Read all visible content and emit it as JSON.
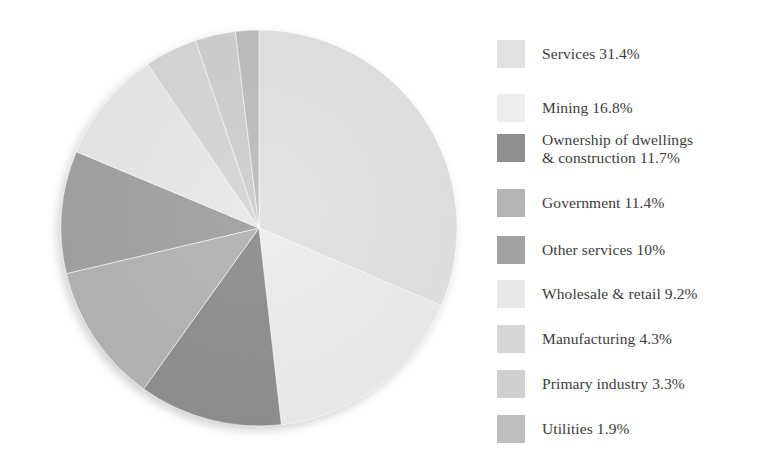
{
  "chart_data": {
    "type": "pie",
    "title": "",
    "subtitle": "",
    "xlabel": "",
    "ylabel": "",
    "legend_position": "right",
    "grid": false,
    "start_angle_deg": 0,
    "direction": "clockwise",
    "unit": "%",
    "categories": [
      "Services",
      "Mining",
      "Ownership of dwellings & construction",
      "Government",
      "Other services",
      "Wholesale & retail",
      "Manufacturing",
      "Primary industry",
      "Utilities"
    ],
    "values": [
      31.4,
      16.8,
      11.7,
      11.4,
      10.0,
      9.2,
      4.3,
      3.3,
      1.9
    ],
    "colors": [
      "#e2e2e2",
      "#ededed",
      "#8f8f8f",
      "#b4b4b4",
      "#a2a2a2",
      "#e8e8e8",
      "#d6d6d6",
      "#cfcfcf",
      "#bdbdbd"
    ],
    "slices": [
      {
        "label": "Services",
        "value": 31.4,
        "display": "31.4%",
        "color": "#e2e2e2"
      },
      {
        "label": "Mining",
        "value": 16.8,
        "display": "16.8%",
        "color": "#ededed"
      },
      {
        "label": "Ownership of dwellings & construction",
        "value": 11.7,
        "display": "11.7%",
        "color": "#8f8f8f"
      },
      {
        "label": "Government",
        "value": 11.4,
        "display": "11.4%",
        "color": "#b4b4b4"
      },
      {
        "label": "Other services",
        "value": 10.0,
        "display": "10%",
        "color": "#a2a2a2"
      },
      {
        "label": "Wholesale & retail",
        "value": 9.2,
        "display": "9.2%",
        "color": "#e8e8e8"
      },
      {
        "label": "Manufacturing",
        "value": 4.3,
        "display": "4.3%",
        "color": "#d6d6d6"
      },
      {
        "label": "Primary industry",
        "value": 3.3,
        "display": "3.3%",
        "color": "#cfcfcf"
      },
      {
        "label": "Utilities",
        "value": 1.9,
        "display": "1.9%",
        "color": "#bdbdbd"
      }
    ]
  },
  "legend": {
    "entries": [
      {
        "text": "Services 31.4%",
        "swatch": "#e2e2e2",
        "top": 14,
        "two_line": false
      },
      {
        "text": "Mining 16.8%",
        "swatch": "#ededed",
        "top": 68,
        "two_line": false
      },
      {
        "text": "Ownership of dwellings\n& construction 11.7%",
        "swatch": "#8f8f8f",
        "top": 105,
        "two_line": true
      },
      {
        "text": "Government 11.4%",
        "swatch": "#b4b4b4",
        "top": 163,
        "two_line": false
      },
      {
        "text": "Other services 10%",
        "swatch": "#a2a2a2",
        "top": 210,
        "two_line": false
      },
      {
        "text": "Wholesale & retail 9.2%",
        "swatch": "#e8e8e8",
        "top": 254,
        "two_line": false
      },
      {
        "text": "Manufacturing 4.3%",
        "swatch": "#d6d6d6",
        "top": 299,
        "two_line": false
      },
      {
        "text": "Primary industry 3.3%",
        "swatch": "#cfcfcf",
        "top": 344,
        "two_line": false
      },
      {
        "text": " Utilities 1.9%",
        "swatch": "#bdbdbd",
        "top": 389,
        "two_line": false
      }
    ]
  }
}
